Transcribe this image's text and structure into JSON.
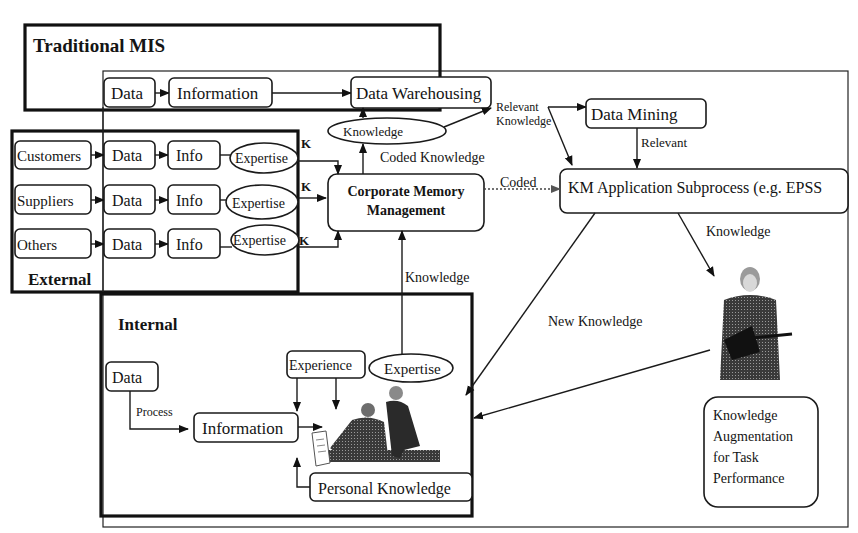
{
  "diagram": {
    "groups": {
      "traditional_mis": "Traditional MIS",
      "external": "External",
      "internal": "Internal"
    },
    "mis": {
      "data": "Data",
      "information": "Information"
    },
    "external_rows": [
      {
        "source": "Customers",
        "data": "Data",
        "info": "Info",
        "expertise": "Expertise",
        "k": "K"
      },
      {
        "source": "Suppliers",
        "data": "Data",
        "info": "Info",
        "expertise": "Expertise",
        "k": "K"
      },
      {
        "source": "Others",
        "data": "Data",
        "info": "Info",
        "expertise": "Expertise",
        "k": "K"
      }
    ],
    "nodes": {
      "data_warehousing": "Data Warehousing",
      "knowledge_ellipse": "Knowledge",
      "data_mining": "Data Mining",
      "km_application": "KM Application Subprocess (e.g. EPSS",
      "corporate_memory_line1": "Corporate Memory",
      "corporate_memory_line2": "Management",
      "knowledge_augmentation": [
        "Knowledge",
        "Augmentation",
        "for Task",
        "Performance"
      ]
    },
    "internal": {
      "data": "Data",
      "process": "Process",
      "information": "Information",
      "experience": "Experience",
      "expertise": "Expertise",
      "personal_knowledge": "Personal Knowledge"
    },
    "edge_labels": {
      "relevant_knowledge_1": "Relevant",
      "relevant_knowledge_2": "Knowledge",
      "relevant": "Relevant",
      "coded_knowledge": "Coded  Knowledge",
      "coded": "Coded",
      "knowledge_right": "Knowledge",
      "knowledge_up": "Knowledge",
      "new_knowledge": "New Knowledge"
    }
  }
}
